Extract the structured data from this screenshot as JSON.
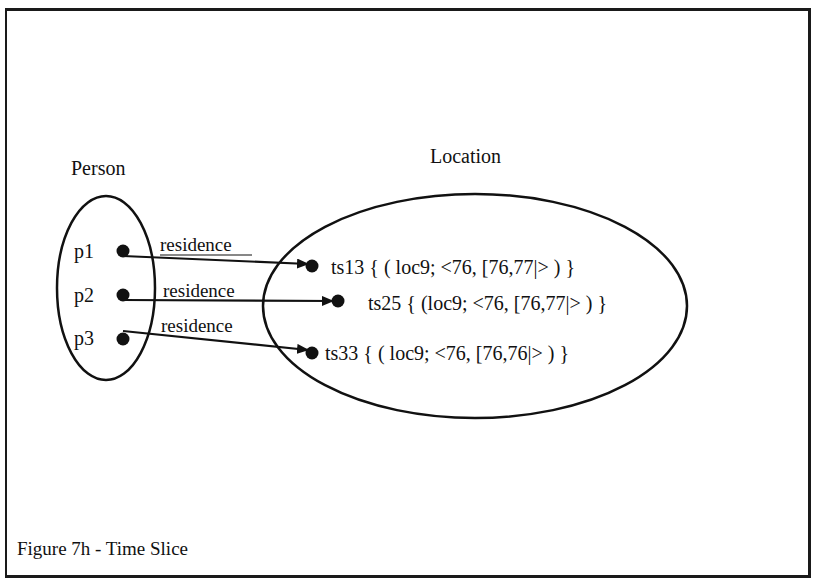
{
  "figure": {
    "caption": "Figure 7h - Time Slice"
  },
  "sets": {
    "person": {
      "title": "Person",
      "members": [
        {
          "id": "p1",
          "label": "p1"
        },
        {
          "id": "p2",
          "label": "p2"
        },
        {
          "id": "p3",
          "label": "p3"
        }
      ]
    },
    "location": {
      "title": "Location",
      "members": [
        {
          "id": "ts13",
          "label": "ts13 { ( loc9; <76, [76,77|> ) }"
        },
        {
          "id": "ts25",
          "label": "ts25 { (loc9; <76, [76,77|> ) }"
        },
        {
          "id": "ts33",
          "label": "ts33 { ( loc9; <76, [76,76|> ) }"
        }
      ]
    }
  },
  "relations": [
    {
      "from": "p1",
      "to": "ts13",
      "label": "residence"
    },
    {
      "from": "p2",
      "to": "ts25",
      "label": "residence"
    },
    {
      "from": "p3",
      "to": "ts33",
      "label": "residence"
    }
  ],
  "colors": {
    "ink": "#111111",
    "background": "#ffffff"
  }
}
